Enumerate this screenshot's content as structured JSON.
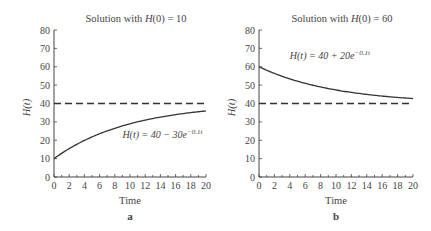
{
  "chart_data": [
    {
      "type": "line",
      "panel_label": "a",
      "title": "Solution with H(0) = 10",
      "title_parts": {
        "prefix": "Solution with ",
        "func": "H",
        "arg": "(0) = 10"
      },
      "xlabel": "Time",
      "ylabel": "H(t)",
      "xlim": [
        0,
        20
      ],
      "ylim": [
        0,
        80
      ],
      "xticks": [
        0,
        2,
        4,
        6,
        8,
        10,
        12,
        14,
        16,
        18,
        20
      ],
      "yticks": [
        0,
        10,
        20,
        30,
        40,
        50,
        60,
        70,
        80
      ],
      "grid": false,
      "series": [
        {
          "name": "H(t) = 40 − 30e^{−0.1t}",
          "style": "solid",
          "formula": {
            "a": 40,
            "b": -30,
            "k": -0.1
          },
          "x": [
            0,
            2,
            4,
            6,
            8,
            10,
            12,
            14,
            16,
            18,
            20
          ],
          "values": [
            10,
            15.4,
            19.9,
            23.5,
            26.5,
            29.0,
            31.0,
            32.6,
            34.0,
            35.0,
            35.9
          ]
        },
        {
          "name": "Equilibrium H = 40",
          "style": "dashed",
          "x": [
            0,
            20
          ],
          "values": [
            40,
            40
          ]
        }
      ],
      "annotation": {
        "text_main": "H(t) = 40 − 30e",
        "text_sup": "−0.1t",
        "x": 9,
        "y": 21
      }
    },
    {
      "type": "line",
      "panel_label": "b",
      "title": "Solution with H(0) = 60",
      "title_parts": {
        "prefix": "Solution with ",
        "func": "H",
        "arg": "(0) = 60"
      },
      "xlabel": "Time",
      "ylabel": "H(t)",
      "xlim": [
        0,
        20
      ],
      "ylim": [
        0,
        80
      ],
      "xticks": [
        0,
        2,
        4,
        6,
        8,
        10,
        12,
        14,
        16,
        18,
        20
      ],
      "yticks": [
        0,
        10,
        20,
        30,
        40,
        50,
        60,
        70,
        80
      ],
      "grid": false,
      "series": [
        {
          "name": "H(t) = 40 + 20e^{−0.1t}",
          "style": "solid",
          "formula": {
            "a": 40,
            "b": 20,
            "k": -0.1
          },
          "x": [
            0,
            2,
            4,
            6,
            8,
            10,
            12,
            14,
            16,
            18,
            20
          ],
          "values": [
            60,
            56.4,
            53.4,
            51.0,
            49.0,
            47.4,
            46.0,
            45.0,
            44.0,
            43.3,
            42.7
          ]
        },
        {
          "name": "Equilibrium H = 40",
          "style": "dashed",
          "x": [
            0,
            20
          ],
          "values": [
            40,
            40
          ]
        }
      ],
      "annotation": {
        "text_main": "H(t) = 40 + 20e",
        "text_sup": "−0.1t",
        "x": 4,
        "y": 64
      }
    }
  ]
}
